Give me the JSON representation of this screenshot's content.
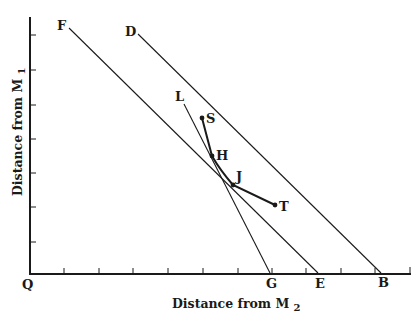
{
  "diagram": {
    "type": "location-triangle isodapane diagram",
    "colors": {
      "ink": "#1a1a1a",
      "background": "#ffffff"
    },
    "axes": {
      "x_label": "Distance from M",
      "x_label_sub": "2",
      "y_label": "Distance from M",
      "y_label_sub": "1",
      "origin_label": "Q",
      "x_ticks": 11,
      "y_ticks": 7
    },
    "lines": [
      {
        "name": "FE",
        "start_label": "F",
        "end_label": "E"
      },
      {
        "name": "DB",
        "start_label": "D",
        "end_label": "B"
      },
      {
        "name": "LG",
        "start_label": "L",
        "end_label": "G"
      }
    ],
    "curve": {
      "name": "SHJT",
      "points": [
        "S",
        "H",
        "J",
        "T"
      ]
    },
    "labels": {
      "F": "F",
      "D": "D",
      "L": "L",
      "S": "S",
      "H": "H",
      "J": "J",
      "T": "T",
      "G": "G",
      "E": "E",
      "B": "B",
      "Q": "Q"
    }
  }
}
